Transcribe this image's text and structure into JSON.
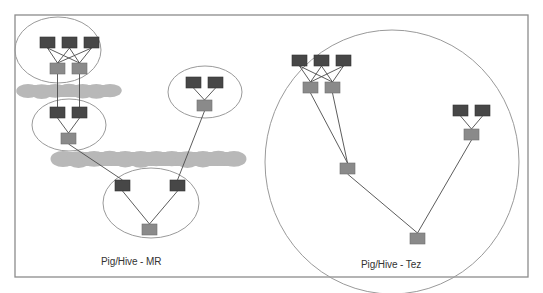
{
  "diagram": {
    "colors": {
      "frame": "#8c8c8c",
      "ellipse": "#9a9a9a",
      "edge": "#4a4a4a",
      "dark_node": "#474747",
      "light_node": "#8a8a8a",
      "blob": "#b8b8b8",
      "text": "#333333"
    },
    "panels": [
      {
        "id": "mr",
        "label": "Pig/Hive - MR",
        "label_pos": {
          "x": 101,
          "y": 256
        }
      },
      {
        "id": "tez",
        "label": "Pig/Hive - Tez",
        "label_pos": {
          "x": 361,
          "y": 259
        }
      }
    ],
    "ellipses": [
      {
        "name": "mr-job1-ellipse",
        "cx": 58,
        "cy": 50,
        "rx": 43,
        "ry": 33
      },
      {
        "name": "mr-job2-ellipse",
        "cx": 69,
        "cy": 125,
        "rx": 37,
        "ry": 26
      },
      {
        "name": "mr-job3-ellipse",
        "cx": 205,
        "cy": 92,
        "rx": 37,
        "ry": 26
      },
      {
        "name": "mr-job4-ellipse",
        "cx": 151,
        "cy": 203,
        "rx": 48,
        "ry": 35
      },
      {
        "name": "tez-dag-ellipse",
        "cx": 392,
        "cy": 162,
        "rx": 127,
        "ry": 132
      }
    ],
    "blobs": [
      {
        "name": "hdfs-write-blob-1",
        "x1": 22,
        "x2": 116,
        "cy": 91,
        "h": 14
      },
      {
        "name": "hdfs-write-blob-2",
        "x1": 57,
        "x2": 240,
        "cy": 159,
        "h": 16
      }
    ],
    "nodes": [
      {
        "id": "mr1m1",
        "type": "dark",
        "x": 40,
        "y": 37,
        "w": 15,
        "h": 11
      },
      {
        "id": "mr1m2",
        "type": "dark",
        "x": 62,
        "y": 37,
        "w": 15,
        "h": 11
      },
      {
        "id": "mr1m3",
        "type": "dark",
        "x": 84,
        "y": 37,
        "w": 15,
        "h": 11
      },
      {
        "id": "mr1r1",
        "type": "light",
        "x": 50,
        "y": 63,
        "w": 15,
        "h": 11
      },
      {
        "id": "mr1r2",
        "type": "light",
        "x": 72,
        "y": 63,
        "w": 15,
        "h": 11
      },
      {
        "id": "mr2m1",
        "type": "dark",
        "x": 50,
        "y": 107,
        "w": 15,
        "h": 11
      },
      {
        "id": "mr2m2",
        "type": "dark",
        "x": 72,
        "y": 107,
        "w": 15,
        "h": 11
      },
      {
        "id": "mr2r1",
        "type": "light",
        "x": 61,
        "y": 133,
        "w": 15,
        "h": 11
      },
      {
        "id": "mr3m1",
        "type": "dark",
        "x": 186,
        "y": 77,
        "w": 15,
        "h": 11
      },
      {
        "id": "mr3m2",
        "type": "dark",
        "x": 208,
        "y": 77,
        "w": 15,
        "h": 11
      },
      {
        "id": "mr3r1",
        "type": "light",
        "x": 197,
        "y": 100,
        "w": 15,
        "h": 11
      },
      {
        "id": "mr4m1",
        "type": "dark",
        "x": 115,
        "y": 180,
        "w": 15,
        "h": 11
      },
      {
        "id": "mr4m2",
        "type": "dark",
        "x": 170,
        "y": 180,
        "w": 15,
        "h": 11
      },
      {
        "id": "mr4r1",
        "type": "light",
        "x": 142,
        "y": 224,
        "w": 15,
        "h": 11
      },
      {
        "id": "tzm1",
        "type": "dark",
        "x": 292,
        "y": 55,
        "w": 15,
        "h": 11
      },
      {
        "id": "tzm2",
        "type": "dark",
        "x": 314,
        "y": 55,
        "w": 15,
        "h": 11
      },
      {
        "id": "tzm3",
        "type": "dark",
        "x": 336,
        "y": 55,
        "w": 15,
        "h": 11
      },
      {
        "id": "tzr1",
        "type": "light",
        "x": 303,
        "y": 82,
        "w": 15,
        "h": 11
      },
      {
        "id": "tzr2",
        "type": "light",
        "x": 325,
        "y": 82,
        "w": 15,
        "h": 11
      },
      {
        "id": "tzm4",
        "type": "dark",
        "x": 453,
        "y": 105,
        "w": 15,
        "h": 11
      },
      {
        "id": "tzm5",
        "type": "dark",
        "x": 475,
        "y": 105,
        "w": 15,
        "h": 11
      },
      {
        "id": "tzr3",
        "type": "light",
        "x": 464,
        "y": 129,
        "w": 15,
        "h": 11
      },
      {
        "id": "tzr4",
        "type": "light",
        "x": 340,
        "y": 163,
        "w": 15,
        "h": 11
      },
      {
        "id": "tzr5",
        "type": "light",
        "x": 410,
        "y": 233,
        "w": 15,
        "h": 11
      }
    ],
    "edges": [
      [
        "mr1m1",
        "mr1r1"
      ],
      [
        "mr1m1",
        "mr1r2"
      ],
      [
        "mr1m2",
        "mr1r1"
      ],
      [
        "mr1m2",
        "mr1r2"
      ],
      [
        "mr1m3",
        "mr1r1"
      ],
      [
        "mr1m3",
        "mr1r2"
      ],
      [
        "mr1r1",
        "mr2m1"
      ],
      [
        "mr1r2",
        "mr2m2"
      ],
      [
        "mr2m1",
        "mr2r1"
      ],
      [
        "mr2m2",
        "mr2r1"
      ],
      [
        "mr3m1",
        "mr3r1"
      ],
      [
        "mr3m2",
        "mr3r1"
      ],
      [
        "mr2r1",
        "mr4m1"
      ],
      [
        "mr3r1",
        "mr4m2"
      ],
      [
        "mr4m1",
        "mr4r1"
      ],
      [
        "mr4m2",
        "mr4r1"
      ],
      [
        "tzm1",
        "tzr1"
      ],
      [
        "tzm1",
        "tzr2"
      ],
      [
        "tzm2",
        "tzr1"
      ],
      [
        "tzm2",
        "tzr2"
      ],
      [
        "tzm3",
        "tzr1"
      ],
      [
        "tzm3",
        "tzr2"
      ],
      [
        "tzr1",
        "tzr4"
      ],
      [
        "tzr2",
        "tzr4"
      ],
      [
        "tzm4",
        "tzr3"
      ],
      [
        "tzm5",
        "tzr3"
      ],
      [
        "tzr4",
        "tzr5"
      ],
      [
        "tzr3",
        "tzr5"
      ]
    ],
    "frame": {
      "x1": 15,
      "y1": 15,
      "x2": 528,
      "y2": 277
    }
  }
}
